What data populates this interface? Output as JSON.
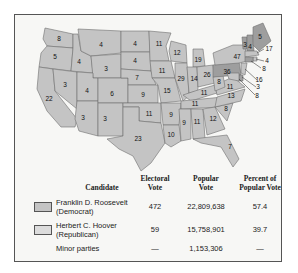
{
  "map": {
    "colors": {
      "democrat": "#c4c4c4",
      "republican": "#9e9e9e",
      "border": "#6e6e6e"
    },
    "state_labels": [
      {
        "id": "WA",
        "value": "8"
      },
      {
        "id": "OR",
        "value": "5"
      },
      {
        "id": "CA",
        "value": "22"
      },
      {
        "id": "ID",
        "value": "4"
      },
      {
        "id": "NV",
        "value": "3"
      },
      {
        "id": "MT",
        "value": "4"
      },
      {
        "id": "WY",
        "value": "3"
      },
      {
        "id": "UT",
        "value": "4"
      },
      {
        "id": "AZ",
        "value": "3"
      },
      {
        "id": "CO",
        "value": "6"
      },
      {
        "id": "NM",
        "value": "3"
      },
      {
        "id": "ND",
        "value": "4"
      },
      {
        "id": "SD",
        "value": "4"
      },
      {
        "id": "NE",
        "value": "7"
      },
      {
        "id": "KS",
        "value": "9"
      },
      {
        "id": "OK",
        "value": "11"
      },
      {
        "id": "TX",
        "value": "23"
      },
      {
        "id": "MN",
        "value": "11"
      },
      {
        "id": "IA",
        "value": "11"
      },
      {
        "id": "MO",
        "value": "15"
      },
      {
        "id": "AR",
        "value": "9"
      },
      {
        "id": "LA",
        "value": "10"
      },
      {
        "id": "WI",
        "value": "12"
      },
      {
        "id": "IL",
        "value": "29"
      },
      {
        "id": "MI",
        "value": "19"
      },
      {
        "id": "IN",
        "value": "14"
      },
      {
        "id": "OH",
        "value": "26"
      },
      {
        "id": "KY",
        "value": "11"
      },
      {
        "id": "TN",
        "value": "11"
      },
      {
        "id": "MS",
        "value": "9"
      },
      {
        "id": "AL",
        "value": "11"
      },
      {
        "id": "GA",
        "value": "12"
      },
      {
        "id": "FL",
        "value": "7"
      },
      {
        "id": "SC",
        "value": "8"
      },
      {
        "id": "NC",
        "value": "13"
      },
      {
        "id": "VA",
        "value": "11"
      },
      {
        "id": "WV",
        "value": "8"
      },
      {
        "id": "PA",
        "value": "36"
      },
      {
        "id": "NY",
        "value": "47"
      },
      {
        "id": "VT",
        "value": "3"
      },
      {
        "id": "NH",
        "value": "4"
      },
      {
        "id": "ME",
        "value": "5"
      },
      {
        "id": "MA",
        "value": "17"
      },
      {
        "id": "RI",
        "value": "4"
      },
      {
        "id": "CT",
        "value": "8"
      },
      {
        "id": "NJ",
        "value": "16"
      },
      {
        "id": "DE",
        "value": "3"
      },
      {
        "id": "MD",
        "value": "8"
      }
    ]
  },
  "table": {
    "headers": {
      "candidate": "Candidate",
      "electoral": [
        "Electoral",
        "Vote"
      ],
      "popular": [
        "Popular",
        "Vote"
      ],
      "percent": [
        "Percent of",
        "Popular Vote"
      ]
    },
    "rows": [
      {
        "name": [
          "Franklin D. Roosevelt",
          "(Democrat)"
        ],
        "electoral": "472",
        "popular": "22,809,638",
        "percent": "57.4",
        "swatch": "#c4c4c4"
      },
      {
        "name": [
          "Herbert C. Hoover",
          "(Republican)"
        ],
        "electoral": "59",
        "popular": "15,758,901",
        "percent": "39.7",
        "swatch": "#dcdcdc"
      },
      {
        "name": [
          "Minor parties"
        ],
        "electoral": "—",
        "popular": "1,153,306",
        "percent": "—"
      }
    ]
  }
}
